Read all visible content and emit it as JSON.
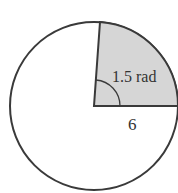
{
  "diagram": {
    "type": "circle-sector",
    "radius_label": "6",
    "angle_label": "1.5 rad",
    "angle_rad": 1.5,
    "colors": {
      "stroke": "#3a3a3a",
      "sector_fill": "#d6d6d6",
      "background": "#ffffff"
    }
  }
}
